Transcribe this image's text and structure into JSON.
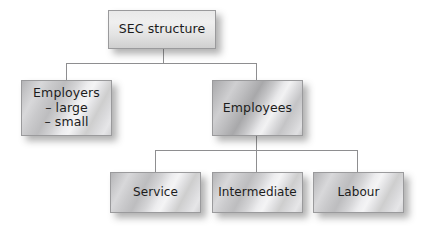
{
  "diagram": {
    "type": "hierarchy-tree",
    "title": "SEC structure",
    "orientation": "top-down",
    "levels": 3,
    "colors": {
      "box_fill_light": "#efefef",
      "box_fill_metal": "#c8c8ca",
      "box_border": "#9a9a9c",
      "connector": "#8e8e90",
      "text": "#1c1c1c",
      "shadow": "rgba(60,60,60,0.40)",
      "background": "#ffffff"
    },
    "nodes": {
      "root": {
        "label": "SEC structure",
        "level": 1
      },
      "employers": {
        "label": "Employers\n– large\n– small",
        "line1": "Employers",
        "line2": "– large",
        "line3": "– small",
        "level": 2
      },
      "employees": {
        "label": "Employees",
        "level": 2
      },
      "service": {
        "label": "Service",
        "level": 3
      },
      "intermediate": {
        "label": "Intermediate",
        "level": 3
      },
      "labour": {
        "label": "Labour",
        "level": 3
      }
    },
    "edges": [
      {
        "from": "root",
        "to": "employers"
      },
      {
        "from": "root",
        "to": "employees"
      },
      {
        "from": "employees",
        "to": "service"
      },
      {
        "from": "employees",
        "to": "intermediate"
      },
      {
        "from": "employees",
        "to": "labour"
      }
    ]
  }
}
